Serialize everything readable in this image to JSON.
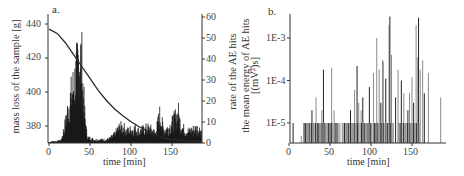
{
  "chart_data": [
    {
      "panel": "a.",
      "type": "bar+line",
      "title": "",
      "xlabel": "time [min]",
      "ylabel_left": "mass loss of the sample [g]",
      "ylabel_right": "rate of the AE hits",
      "xlim": [
        0,
        190
      ],
      "ylim_left": [
        370,
        443
      ],
      "ylim_right": [
        0,
        60
      ],
      "xticks": [
        0,
        50,
        100,
        150
      ],
      "yticks_left": [
        380,
        400,
        420,
        440
      ],
      "yticks_right": [
        0,
        10,
        20,
        30,
        40,
        50,
        60
      ],
      "grid": false,
      "legend": null,
      "series": [
        {
          "name": "mass loss of the sample",
          "axis": "left",
          "kind": "line",
          "x": [
            0,
            10,
            20,
            30,
            40,
            50,
            60,
            70,
            80,
            90,
            100,
            110,
            120,
            130,
            140,
            150,
            160,
            170,
            180,
            185
          ],
          "y": [
            437,
            434.5,
            429,
            422,
            415,
            408,
            401,
            395,
            390,
            386,
            382.5,
            379.5,
            377,
            375,
            373,
            372,
            371.5,
            371.3,
            371.2,
            371.2
          ]
        },
        {
          "name": "rate of the AE hits",
          "axis": "right",
          "kind": "bar",
          "x": [
            0,
            5,
            10,
            15,
            18,
            20,
            22,
            25,
            28,
            30,
            32,
            34,
            36,
            38,
            40,
            42,
            44,
            46,
            48,
            50,
            55,
            60,
            65,
            70,
            75,
            80,
            85,
            90,
            95,
            100,
            105,
            110,
            115,
            120,
            125,
            130,
            135,
            140,
            145,
            150,
            155,
            158,
            160,
            165,
            170,
            175,
            180,
            185
          ],
          "y": [
            0.5,
            1,
            1,
            2,
            8,
            12,
            18,
            25,
            32,
            36,
            40,
            45,
            52,
            56,
            50,
            30,
            15,
            6,
            3,
            3,
            2,
            2,
            2,
            2,
            3,
            5,
            9,
            10,
            7,
            8,
            9,
            7,
            8,
            9,
            8,
            6,
            17,
            8,
            9,
            12,
            16,
            18,
            12,
            8,
            7,
            8,
            9,
            8
          ]
        }
      ]
    },
    {
      "panel": "b.",
      "type": "bar",
      "title": "",
      "xlabel": "time [min]",
      "ylabel": "the mean energy of AE hits [(mV)²s]",
      "ylabel_line1": "the mean energy of AE hits",
      "ylabel_line2": "[(mV²)s]",
      "yscale": "log",
      "xlim": [
        0,
        190
      ],
      "ylim": [
        3e-06,
        0.004
      ],
      "xticks": [
        0,
        50,
        100,
        150
      ],
      "yticks": [
        "1E-5",
        "1E-4",
        "1E-3"
      ],
      "grid": false,
      "legend": null,
      "series": [
        {
          "name": "mean energy of AE hits",
          "x": [
            5,
            15,
            18,
            20,
            22,
            25,
            28,
            30,
            33,
            35,
            38,
            40,
            42,
            45,
            48,
            50,
            52,
            55,
            58,
            62,
            65,
            68,
            70,
            72,
            75,
            78,
            80,
            83,
            85,
            88,
            90,
            92,
            95,
            98,
            100,
            103,
            105,
            107,
            110,
            112,
            114,
            115,
            118,
            120,
            122,
            123,
            125,
            127,
            130,
            133,
            135,
            137,
            140,
            142,
            145,
            147,
            150,
            152,
            155,
            157,
            158,
            160,
            163,
            165,
            170,
            185
          ],
          "y": [
            1e-05,
            5e-06,
            1e-05,
            1e-05,
            1e-05,
            1e-05,
            2e-05,
            1e-05,
            4e-05,
            1e-05,
            1e-05,
            2e-05,
            0.00018,
            1e-05,
            1e-05,
            1e-05,
            0.0002,
            2e-05,
            1e-05,
            1e-05,
            1e-05,
            1e-05,
            1e-05,
            1e-05,
            2e-05,
            1e-05,
            6e-05,
            0.00022,
            3e-05,
            2e-05,
            4e-05,
            1e-05,
            1e-05,
            7e-05,
            1e-05,
            0.00015,
            1e-05,
            0.001,
            0.00018,
            3e-05,
            0.0003,
            0.00028,
            0.00011,
            1e-05,
            0.002,
            0.0032,
            0.0004,
            1e-05,
            4e-05,
            0.00018,
            1e-05,
            0.0001,
            5e-05,
            1e-05,
            2e-05,
            5e-05,
            0.00012,
            3e-05,
            0.002,
            0.00035,
            0.003,
            0.00018,
            0.0003,
            5e-05,
            0.00015,
            4e-05
          ]
        }
      ]
    }
  ],
  "labels": {
    "panel_a": "a.",
    "panel_b": "b.",
    "a_xlabel": "time [min]",
    "a_ylabel_left": "mass loss of the sample [g]",
    "a_ylabel_right": "rate of the AE hits",
    "b_xlabel": "time [min]",
    "b_ylabel_line1": "the mean energy of AE hits",
    "b_ylabel_line2": "[(mV²)s]"
  },
  "ticks": {
    "a_x": [
      "0",
      "50",
      "100",
      "150"
    ],
    "a_left": [
      "440",
      "420",
      "400",
      "380"
    ],
    "a_right": [
      "60",
      "50",
      "40",
      "30",
      "20",
      "10",
      "0"
    ],
    "b_x": [
      "0",
      "50",
      "100",
      "150"
    ],
    "b_y": [
      "1E-3",
      "1E-4",
      "1E-5"
    ]
  },
  "colors": {
    "axis": "#333333",
    "curve": "#2a2a2a",
    "bars_a": "#111111",
    "bars_b_dark": "#222222",
    "bars_b_light": "#8a8a8a"
  }
}
